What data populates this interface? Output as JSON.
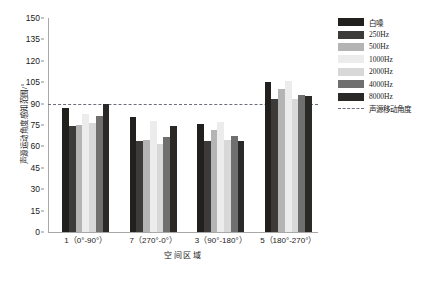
{
  "chart_data": {
    "type": "bar",
    "title": "",
    "xlabel": "空间区域",
    "ylabel": "声源运动角度感知范围/°",
    "categories": [
      "1（0°-90°）",
      "7（270°-0°）",
      "3（90°-180°）",
      "5（180°-270°）"
    ],
    "series": [
      {
        "name": "白噪",
        "color": "#221f1f",
        "values": [
          87,
          80.5,
          76,
          105
        ]
      },
      {
        "name": "250Hz",
        "color": "#3d3a3a",
        "values": [
          74.5,
          64,
          63.5,
          93
        ]
      },
      {
        "name": "500Hz",
        "color": "#b4b4b4",
        "values": [
          75,
          64.5,
          71.5,
          100
        ]
      },
      {
        "name": "1000Hz",
        "color": "#ececec",
        "values": [
          83,
          78,
          77,
          106
        ]
      },
      {
        "name": "2000Hz",
        "color": "#d8d8d8",
        "values": [
          76.5,
          62,
          64.5,
          93
        ]
      },
      {
        "name": "4000Hz",
        "color": "#6f6f6f",
        "values": [
          81.5,
          66.5,
          67.5,
          96
        ]
      },
      {
        "name": "8000Hz",
        "color": "#2b2828",
        "values": [
          90,
          74.5,
          64,
          95
        ]
      }
    ],
    "ylim": [
      0,
      150
    ],
    "yticks": [
      0,
      15,
      30,
      45,
      60,
      75,
      90,
      105,
      120,
      135,
      150
    ],
    "grid": false,
    "legend_position": "right",
    "reference_line": {
      "label": "声源移动角度",
      "value": 90,
      "style": "dashed",
      "color": "#6e6e7a"
    }
  },
  "legend": {
    "entries": [
      {
        "label": "白噪"
      },
      {
        "label": "250Hz"
      },
      {
        "label": "500Hz"
      },
      {
        "label": "1000Hz"
      },
      {
        "label": "2000Hz"
      },
      {
        "label": "4000Hz"
      },
      {
        "label": "8000Hz"
      }
    ],
    "reference_label": "声源移动角度"
  }
}
